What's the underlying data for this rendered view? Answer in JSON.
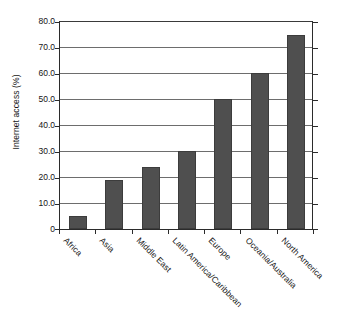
{
  "chart_data": {
    "type": "bar",
    "title": "",
    "subtitle": "",
    "xlabel": "",
    "ylabel": "Internet access (%)",
    "categories": [
      "Africa",
      "Asia",
      "Middle East",
      "Latin America/Caribbean",
      "Europe",
      "Oceania/Australia",
      "North America"
    ],
    "values": [
      5.0,
      19.0,
      24.0,
      30.0,
      50.0,
      60.0,
      74.5
    ],
    "ylim": [
      0,
      80
    ],
    "ytick_values": [
      0,
      10,
      20,
      30,
      40,
      50,
      60,
      70,
      80
    ],
    "ytick_labels": [
      "0",
      "10.0",
      "20.0",
      "30.0",
      "40.0",
      "50.0",
      "60.0",
      "70.0",
      "80.0"
    ],
    "grid": "horizontal",
    "legend": "none",
    "bar_color": "#4f4f4f",
    "axis_color": "#2b2b2b",
    "gridline_color": "#6d6d6d",
    "background_color": "#ffffff",
    "xtick_label_rotation": 45
  }
}
